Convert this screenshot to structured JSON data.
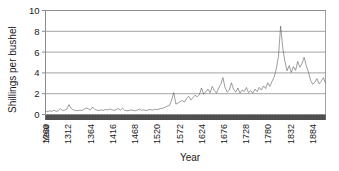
{
  "chart_data": {
    "type": "line",
    "title": "",
    "xlabel": "Year",
    "ylabel": "Shillings per bushel",
    "xlim": [
      1259,
      1914
    ],
    "ylim": [
      0,
      10
    ],
    "grid": true,
    "legend": false,
    "legend_position": "none",
    "y_ticks": [
      0,
      2,
      4,
      6,
      8,
      10
    ],
    "x_ticks": [
      1260,
      1312,
      1364,
      1416,
      1468,
      1520,
      1572,
      1624,
      1676,
      1728,
      1780,
      1832,
      1884
    ],
    "x_tick_labels": [
      "1260",
      "1312",
      "1364",
      "1416",
      "1468",
      "1520",
      "1572",
      "1624",
      "1676",
      "1728",
      "1780",
      "1832",
      "1884"
    ],
    "x_origin_label": "Year",
    "series_name": "Wheat price",
    "line_color": "#4d4d4d",
    "axis_color": "#8c8c8c",
    "x": [
      1259,
      1264,
      1269,
      1274,
      1279,
      1284,
      1289,
      1294,
      1299,
      1304,
      1309,
      1314,
      1319,
      1324,
      1329,
      1334,
      1339,
      1344,
      1349,
      1354,
      1359,
      1364,
      1369,
      1374,
      1379,
      1384,
      1389,
      1394,
      1399,
      1404,
      1409,
      1414,
      1419,
      1424,
      1429,
      1434,
      1439,
      1444,
      1449,
      1454,
      1459,
      1464,
      1469,
      1474,
      1479,
      1484,
      1489,
      1494,
      1499,
      1504,
      1509,
      1514,
      1519,
      1524,
      1529,
      1534,
      1539,
      1544,
      1549,
      1554,
      1559,
      1564,
      1569,
      1574,
      1579,
      1584,
      1589,
      1594,
      1599,
      1604,
      1609,
      1614,
      1619,
      1624,
      1629,
      1634,
      1639,
      1644,
      1649,
      1654,
      1659,
      1664,
      1669,
      1674,
      1679,
      1684,
      1689,
      1694,
      1699,
      1704,
      1709,
      1714,
      1719,
      1724,
      1729,
      1734,
      1739,
      1744,
      1749,
      1754,
      1759,
      1764,
      1769,
      1774,
      1779,
      1784,
      1789,
      1794,
      1799,
      1804,
      1809,
      1814,
      1819,
      1824,
      1829,
      1834,
      1839,
      1844,
      1849,
      1854,
      1859,
      1864,
      1869,
      1874,
      1879,
      1884,
      1889,
      1894,
      1899,
      1904,
      1909,
      1914
    ],
    "y": [
      0.32,
      0.28,
      0.35,
      0.3,
      0.42,
      0.3,
      0.36,
      0.55,
      0.38,
      0.42,
      0.52,
      0.95,
      0.58,
      0.44,
      0.4,
      0.36,
      0.42,
      0.38,
      0.5,
      0.62,
      0.55,
      0.44,
      0.72,
      0.5,
      0.42,
      0.38,
      0.44,
      0.4,
      0.48,
      0.44,
      0.52,
      0.46,
      0.4,
      0.44,
      0.58,
      0.42,
      0.6,
      0.4,
      0.36,
      0.38,
      0.44,
      0.4,
      0.36,
      0.42,
      0.52,
      0.4,
      0.46,
      0.38,
      0.44,
      0.48,
      0.42,
      0.5,
      0.46,
      0.52,
      0.58,
      0.62,
      0.7,
      0.8,
      0.88,
      1.4,
      2.1,
      1.0,
      1.1,
      1.25,
      1.35,
      1.2,
      1.55,
      1.75,
      1.4,
      1.6,
      1.85,
      1.7,
      1.9,
      2.55,
      1.95,
      2.2,
      2.45,
      2.1,
      2.7,
      2.3,
      2.05,
      2.55,
      2.9,
      3.55,
      2.6,
      2.15,
      2.35,
      3.05,
      2.4,
      2.15,
      2.55,
      2.05,
      2.35,
      2.2,
      2.6,
      2.1,
      2.3,
      2.05,
      2.45,
      2.2,
      2.6,
      2.35,
      2.75,
      2.5,
      3.05,
      2.7,
      3.2,
      3.6,
      4.4,
      5.6,
      8.5,
      6.4,
      5.1,
      4.2,
      4.7,
      4.05,
      4.6,
      4.25,
      5.1,
      4.55,
      4.9,
      5.5,
      4.7,
      4.1,
      3.3,
      2.9,
      3.1,
      3.45,
      2.95,
      3.2,
      3.55,
      3.0
    ]
  }
}
